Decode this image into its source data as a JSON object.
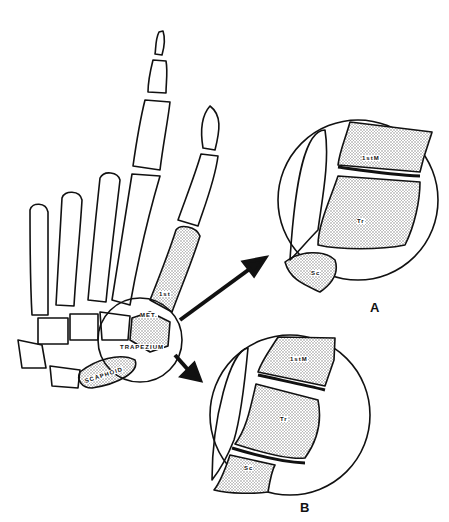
{
  "figure": {
    "main_labels": {
      "first_metacarpal_top": "1st",
      "first_metacarpal_bottom": "MET.",
      "trapezium": "TRAPEZIUM",
      "scaphoid": "SCAPHOID"
    },
    "inset_a": {
      "panel_label": "A",
      "bones": {
        "first_metacarpal": "1stM",
        "trapezium": "Tr",
        "scaphoid": "Sc"
      },
      "fractures": [
        "1stM-Tr joint"
      ]
    },
    "inset_b": {
      "panel_label": "B",
      "bones": {
        "first_metacarpal": "1stM",
        "trapezium": "Tr",
        "scaphoid": "Sc"
      },
      "fractures": [
        "1stM-Tr joint",
        "Tr-Sc joint"
      ]
    },
    "colors": {
      "line": "#111111",
      "stipple": "#bdbdbd",
      "background": "#ffffff"
    }
  }
}
